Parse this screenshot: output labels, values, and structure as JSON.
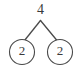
{
  "diagram": {
    "type": "number-bond-tree",
    "background_color": "#ffffff",
    "stroke_color": "#4a4a4a",
    "text_color": "#3a3a3a",
    "root": {
      "label": "4",
      "shape": "plain-text"
    },
    "children": [
      {
        "label": "2",
        "shape": "circle",
        "position": "left"
      },
      {
        "label": "2",
        "shape": "circle",
        "position": "right"
      }
    ],
    "edges": [
      {
        "name": "left-branch"
      },
      {
        "name": "right-branch"
      }
    ]
  }
}
